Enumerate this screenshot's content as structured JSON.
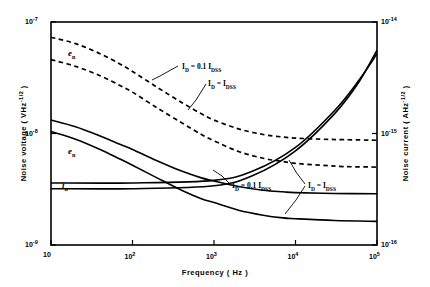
{
  "chart_data": {
    "type": "line",
    "title": "",
    "xlabel": "Frequency  ( Hz )",
    "ylabel_left": "Noise voltage  ( VHz",
    "ylabel_left_exp": "-1/2",
    "ylabel_left_tail": " )",
    "ylabel_right": "Noise current  ( AHz",
    "ylabel_right_exp": "-1/2",
    "ylabel_right_tail": " )",
    "xscale": "log",
    "yscale": "log",
    "xlim": [
      10,
      100000
    ],
    "ylim_left": [
      1e-09,
      1e-07
    ],
    "ylim_right": [
      1e-16,
      1e-14
    ],
    "grid": false,
    "legend_position": "inline-annotations",
    "xticks": [
      {
        "value": 10,
        "label": "10",
        "exp": ""
      },
      {
        "value": 100,
        "label": "10",
        "exp": "2"
      },
      {
        "value": 1000,
        "label": "10",
        "exp": "3"
      },
      {
        "value": 10000,
        "label": "10",
        "exp": "4"
      },
      {
        "value": 100000,
        "label": "10",
        "exp": "5"
      }
    ],
    "yticks_left": [
      {
        "value": 1e-07,
        "label": "10",
        "exp": "-7"
      },
      {
        "value": 1e-08,
        "label": "10",
        "exp": "-8"
      },
      {
        "value": 1e-09,
        "label": "10",
        "exp": "-9"
      }
    ],
    "yticks_right": [
      {
        "value": 1e-14,
        "label": "10",
        "exp": "-14"
      },
      {
        "value": 1e-15,
        "label": "10",
        "exp": "-15"
      },
      {
        "value": 1e-16,
        "label": "10",
        "exp": "-16"
      }
    ],
    "series": [
      {
        "name": "en_0.1Idss",
        "label": "e",
        "sub": "n",
        "style": "dashed",
        "axis": "left",
        "condition": "I_D = 0.1 I_DSS",
        "points": [
          [
            10,
            7.3e-08
          ],
          [
            20,
            6.4e-08
          ],
          [
            40,
            5.2e-08
          ],
          [
            70,
            4.2e-08
          ],
          [
            100,
            3.6e-08
          ],
          [
            200,
            2.6e-08
          ],
          [
            400,
            1.9e-08
          ],
          [
            700,
            1.5e-08
          ],
          [
            1000,
            1.32e-08
          ],
          [
            2000,
            1.1e-08
          ],
          [
            4000,
            9.8e-09
          ],
          [
            7000,
            9.3e-09
          ],
          [
            10000,
            9.1e-09
          ],
          [
            20000,
            8.9e-09
          ],
          [
            40000,
            8.8e-09
          ],
          [
            100000,
            8.7e-09
          ]
        ]
      },
      {
        "name": "en_Idss",
        "label": "e",
        "sub": "n",
        "style": "dashed",
        "axis": "left",
        "condition": "I_D = I_DSS",
        "points": [
          [
            10,
            4.6e-08
          ],
          [
            20,
            4e-08
          ],
          [
            40,
            3.3e-08
          ],
          [
            70,
            2.7e-08
          ],
          [
            100,
            2.35e-08
          ],
          [
            200,
            1.7e-08
          ],
          [
            400,
            1.25e-08
          ],
          [
            700,
            9.8e-09
          ],
          [
            1000,
            8.6e-09
          ],
          [
            2000,
            6.9e-09
          ],
          [
            4000,
            6e-09
          ],
          [
            7000,
            5.6e-09
          ],
          [
            10000,
            5.4e-09
          ],
          [
            20000,
            5.2e-09
          ],
          [
            40000,
            5.05e-09
          ],
          [
            100000,
            5e-09
          ]
        ]
      },
      {
        "name": "in_0.1Idss",
        "label": "i",
        "sub": "n",
        "style": "solid",
        "axis": "right",
        "condition": "I_D = 0.1 I_DSS",
        "points": [
          [
            10,
            3.6e-16
          ],
          [
            100,
            3.6e-16
          ],
          [
            1000,
            3.8e-16
          ],
          [
            3000,
            4.6e-16
          ],
          [
            10000,
            7.5e-16
          ],
          [
            30000,
            1.6e-15
          ],
          [
            60000,
            3e-15
          ],
          [
            100000,
            5.2e-15
          ]
        ]
      },
      {
        "name": "in_Idss",
        "label": "i",
        "sub": "n",
        "style": "solid",
        "axis": "right",
        "condition": "I_D = I_DSS",
        "points": [
          [
            10,
            3.2e-16
          ],
          [
            100,
            3.2e-16
          ],
          [
            1000,
            3.4e-16
          ],
          [
            3000,
            4.2e-16
          ],
          [
            10000,
            7e-16
          ],
          [
            30000,
            1.5e-15
          ],
          [
            60000,
            2.9e-15
          ],
          [
            100000,
            5.6e-15
          ]
        ]
      },
      {
        "name": "en_solid_0.1Idss",
        "label": "e",
        "sub": "n",
        "style": "solid",
        "axis": "left",
        "condition": "I_D = 0.1 I_DSS",
        "points": [
          [
            10,
            1.32e-08
          ],
          [
            20,
            1.15e-08
          ],
          [
            40,
            9.5e-09
          ],
          [
            70,
            8e-09
          ],
          [
            100,
            7.2e-09
          ],
          [
            200,
            5.7e-09
          ],
          [
            400,
            4.6e-09
          ],
          [
            700,
            4e-09
          ],
          [
            1000,
            3.75e-09
          ],
          [
            2000,
            3.35e-09
          ],
          [
            4000,
            3.1e-09
          ],
          [
            7000,
            3e-09
          ],
          [
            10000,
            2.95e-09
          ],
          [
            30000,
            2.9e-09
          ],
          [
            100000,
            2.88e-09
          ]
        ]
      },
      {
        "name": "en_solid_Idss",
        "label": "e",
        "sub": "n",
        "style": "solid",
        "axis": "left",
        "condition": "I_D = I_DSS",
        "points": [
          [
            10,
            1.04e-08
          ],
          [
            20,
            8.9e-09
          ],
          [
            40,
            7.2e-09
          ],
          [
            70,
            5.9e-09
          ],
          [
            100,
            5.2e-09
          ],
          [
            200,
            4e-09
          ],
          [
            400,
            3.1e-09
          ],
          [
            700,
            2.6e-09
          ],
          [
            1000,
            2.4e-09
          ],
          [
            2000,
            2.05e-09
          ],
          [
            4000,
            1.85e-09
          ],
          [
            7000,
            1.75e-09
          ],
          [
            10000,
            1.72e-09
          ],
          [
            30000,
            1.66e-09
          ],
          [
            100000,
            1.63e-09
          ]
        ]
      }
    ],
    "annotations": [
      {
        "name": "ann-en-dashed-upper",
        "text_main": "I",
        "text_sub": "D",
        "text_rest": " = 0.1 I",
        "text_sub2": "DSS",
        "x": 182,
        "y": 62
      },
      {
        "name": "ann-en-dashed-lower",
        "text_main": "I",
        "text_sub": "D",
        "text_rest": " = I",
        "text_sub2": "DSS",
        "x": 208,
        "y": 79
      },
      {
        "name": "ann-in-solid-upper",
        "text_main": "I",
        "text_sub": "D",
        "text_rest": " = 0.1 I",
        "text_sub2": "DSS",
        "x": 232,
        "y": 181
      },
      {
        "name": "ann-in-solid-lower",
        "text_main": "I",
        "text_sub": "D",
        "text_rest": " = I",
        "text_sub2": "DSS",
        "x": 308,
        "y": 181
      }
    ],
    "curve_labels": [
      {
        "name": "label-en-dashed",
        "main": "e",
        "sub": "n",
        "x": 68,
        "y": 48
      },
      {
        "name": "label-en-solid",
        "main": "e",
        "sub": "n",
        "x": 68,
        "y": 146
      },
      {
        "name": "label-in-solid",
        "main": "i",
        "sub": "n",
        "x": 62,
        "y": 180
      }
    ],
    "colors": {
      "line": "#000000",
      "background": "#ffffff",
      "frame": "#000000"
    }
  }
}
